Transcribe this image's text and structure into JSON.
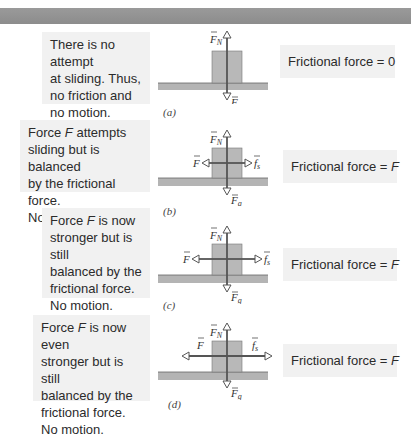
{
  "banner": {
    "color": "#929292"
  },
  "colors": {
    "block_fill": "#b8b8b8",
    "ground_fill": "#b4b4b4",
    "text_box_bg": "#f1f1f1",
    "arrow_color": "#555555"
  },
  "panels": [
    {
      "id": "a",
      "caption": "(a)",
      "description_lines": [
        "There is no attempt",
        "at sliding. Thus,",
        "no friction and",
        "no motion."
      ],
      "result_prefix": "Frictional force = ",
      "result_value": "0",
      "forces": [
        "F_N",
        "F_g"
      ],
      "labels": {
        "normal": "F",
        "normal_sub": "N",
        "gravity": "F",
        "gravity_sub": "g"
      }
    },
    {
      "id": "b",
      "caption": "(b)",
      "description_lines": [
        "Force F attempts",
        "sliding but is balanced",
        "by the frictional force.",
        "No motion."
      ],
      "description_parts": {
        "pre": "Force ",
        "vec": "F",
        "post": " attempts"
      },
      "result_prefix": "Frictional force = ",
      "result_value": "F",
      "forces": [
        "F_N",
        "F_g",
        "F",
        "f_s"
      ],
      "labels": {
        "normal": "F",
        "normal_sub": "N",
        "gravity": "F",
        "gravity_sub": "g",
        "applied": "F",
        "friction": "f",
        "friction_sub": "s"
      }
    },
    {
      "id": "c",
      "caption": "(c)",
      "description_lines": [
        "Force F is now",
        "stronger but is still",
        "balanced by the",
        "frictional force.",
        "No motion."
      ],
      "description_parts": {
        "pre": "Force ",
        "vec": "F",
        "post": " is now"
      },
      "result_prefix": "Frictional force = ",
      "result_value": "F",
      "forces": [
        "F_N",
        "F_g",
        "F",
        "f_s"
      ],
      "labels": {
        "normal": "F",
        "normal_sub": "N",
        "gravity": "F",
        "gravity_sub": "g",
        "applied": "F",
        "friction": "f",
        "friction_sub": "s"
      }
    },
    {
      "id": "d",
      "caption": "(d)",
      "description_lines": [
        "Force F is now even",
        "stronger but is still",
        "balanced by the",
        "frictional force.",
        "No motion."
      ],
      "description_parts": {
        "pre": "Force ",
        "vec": "F",
        "post": " is now even"
      },
      "result_prefix": "Frictional force = ",
      "result_value": "F",
      "forces": [
        "F_N",
        "F_g",
        "F",
        "f_s"
      ],
      "labels": {
        "normal": "F",
        "normal_sub": "N",
        "gravity": "F",
        "gravity_sub": "g",
        "applied": "F",
        "friction": "f",
        "friction_sub": "s"
      }
    }
  ]
}
